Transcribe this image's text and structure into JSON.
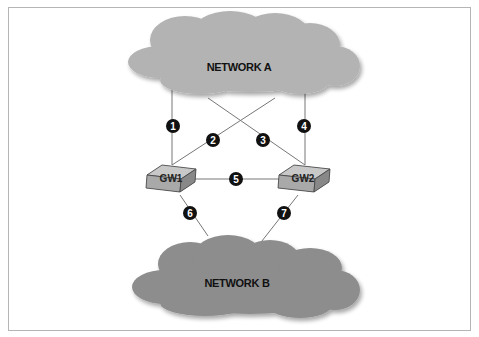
{
  "diagram": {
    "networks": [
      {
        "id": "network-a",
        "label": "NETWORK A",
        "color": "#b3b3b3"
      },
      {
        "id": "network-b",
        "label": "NETWORK B",
        "color": "#8d8d8d"
      }
    ],
    "gateways": [
      {
        "id": "gw1",
        "label": "GW1"
      },
      {
        "id": "gw2",
        "label": "GW2"
      }
    ],
    "links": [
      {
        "number": "1",
        "from": "NETWORK A",
        "to": "GW1"
      },
      {
        "number": "2",
        "from": "NETWORK A",
        "to": "GW1"
      },
      {
        "number": "3",
        "from": "NETWORK A",
        "to": "GW2"
      },
      {
        "number": "4",
        "from": "NETWORK A",
        "to": "GW2"
      },
      {
        "number": "5",
        "from": "GW1",
        "to": "GW2"
      },
      {
        "number": "6",
        "from": "GW1",
        "to": "NETWORK B"
      },
      {
        "number": "7",
        "from": "GW2",
        "to": "NETWORK B"
      }
    ]
  }
}
